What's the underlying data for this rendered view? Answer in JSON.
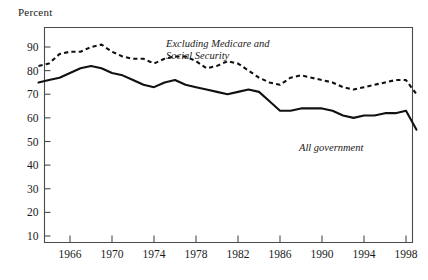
{
  "figure": {
    "y_axis_title": "Percent",
    "background_color": "#ffffff",
    "line_color": "#111111",
    "frame_color": "#4a4a4a"
  },
  "annotations": {
    "dashed_line_1": "Excluding Medicare and",
    "dashed_line_2": "Social Security",
    "solid_label": "All government"
  },
  "chart_data": {
    "type": "line",
    "title": "",
    "xlabel": "",
    "ylabel": "Percent",
    "xlim": [
      1963,
      1999
    ],
    "ylim": [
      0,
      95
    ],
    "grid": false,
    "legend_position": "inline-annotation",
    "x_tick_labels": [
      "1966",
      "1970",
      "1974",
      "1978",
      "1982",
      "1986",
      "1990",
      "1994",
      "1998"
    ],
    "x_ticks": [
      1966,
      1970,
      1974,
      1978,
      1982,
      1986,
      1990,
      1994,
      1998
    ],
    "y_tick_labels": [
      "10",
      "20",
      "30",
      "40",
      "50",
      "60",
      "70",
      "80",
      "90"
    ],
    "y_ticks": [
      10,
      20,
      30,
      40,
      50,
      60,
      70,
      80,
      90
    ],
    "x": [
      1963,
      1964,
      1965,
      1966,
      1967,
      1968,
      1969,
      1970,
      1971,
      1972,
      1973,
      1974,
      1975,
      1976,
      1977,
      1978,
      1979,
      1980,
      1981,
      1982,
      1983,
      1984,
      1985,
      1986,
      1987,
      1988,
      1989,
      1990,
      1991,
      1992,
      1993,
      1994,
      1995,
      1996,
      1997,
      1998,
      1999
    ],
    "series": [
      {
        "name": "Excluding Medicare and Social Security",
        "style": "dashed",
        "values": [
          82,
          83,
          87,
          88,
          88,
          90,
          91,
          88,
          86,
          85,
          85,
          83,
          85,
          86,
          86,
          84,
          81,
          82,
          84,
          83,
          80,
          77,
          75,
          74,
          77,
          78,
          77,
          76,
          75,
          73,
          72,
          73,
          74,
          75,
          76,
          76,
          70
        ]
      },
      {
        "name": "All government",
        "style": "solid",
        "values": [
          75,
          76,
          77,
          79,
          81,
          82,
          81,
          79,
          78,
          76,
          74,
          73,
          75,
          76,
          74,
          73,
          72,
          71,
          70,
          71,
          72,
          71,
          67,
          63,
          63,
          64,
          64,
          64,
          63,
          61,
          60,
          61,
          61,
          62,
          62,
          63,
          55
        ]
      }
    ]
  }
}
